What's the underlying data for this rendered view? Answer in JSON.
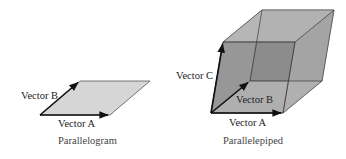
{
  "figures": [
    {
      "name": "parallelogram",
      "caption": "Parallelogram",
      "labels": {
        "vector_a": "Vector A",
        "vector_b": "Vector B"
      },
      "fill": "#d6d6d6"
    },
    {
      "name": "parallelepiped",
      "caption": "Parallelepiped",
      "labels": {
        "vector_a": "Vector A",
        "vector_b": "Vector B",
        "vector_c": "Vector C"
      },
      "colors": {
        "base": "#dcdcdc",
        "front": "#9a9a9a",
        "top": "#b4b4b4",
        "right": "#a8a8a8",
        "back": "#8e8e8e"
      }
    }
  ],
  "colors": {
    "edge": "#333333",
    "vector": "#111111"
  }
}
